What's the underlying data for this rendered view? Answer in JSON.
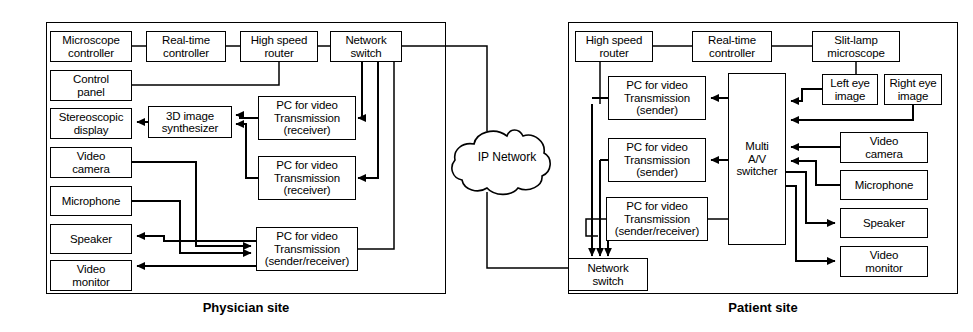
{
  "diagram": {
    "panels": [
      {
        "id": "physician",
        "caption": "Physician site",
        "frame": {
          "x": 46,
          "y": 22,
          "w": 400,
          "h": 272
        }
      },
      {
        "id": "patient",
        "caption": "Patient site",
        "frame": {
          "x": 568,
          "y": 22,
          "w": 390,
          "h": 272
        }
      }
    ],
    "cloud": {
      "label": "IP Network",
      "cx": 507,
      "cy": 156
    },
    "nodes": [
      {
        "id": "ph-microscope-controller",
        "lines": [
          "Microscope",
          "controller"
        ],
        "x": 50,
        "y": 31,
        "w": 82,
        "h": 31
      },
      {
        "id": "ph-realtime-controller",
        "lines": [
          "Real-time",
          "controller"
        ],
        "x": 146,
        "y": 31,
        "w": 80,
        "h": 31
      },
      {
        "id": "ph-high-speed-router",
        "lines": [
          "High speed",
          "router"
        ],
        "x": 240,
        "y": 31,
        "w": 78,
        "h": 31
      },
      {
        "id": "ph-network-switch",
        "lines": [
          "Network",
          "switch"
        ],
        "x": 330,
        "y": 31,
        "w": 72,
        "h": 31
      },
      {
        "id": "ph-control-panel",
        "lines": [
          "Control",
          "panel"
        ],
        "x": 50,
        "y": 70,
        "w": 82,
        "h": 31
      },
      {
        "id": "ph-stereoscopic-display",
        "lines": [
          "Stereoscopic",
          "display"
        ],
        "x": 50,
        "y": 108,
        "w": 82,
        "h": 31
      },
      {
        "id": "ph-3d-synthesizer",
        "lines": [
          "3D image",
          "synthesizer"
        ],
        "x": 148,
        "y": 106,
        "w": 84,
        "h": 32
      },
      {
        "id": "ph-video-camera",
        "lines": [
          "Video",
          "camera"
        ],
        "x": 50,
        "y": 147,
        "w": 82,
        "h": 31
      },
      {
        "id": "ph-microphone",
        "lines": [
          "Microphone"
        ],
        "x": 50,
        "y": 186,
        "w": 82,
        "h": 30
      },
      {
        "id": "ph-speaker",
        "lines": [
          "Speaker"
        ],
        "x": 50,
        "y": 224,
        "w": 82,
        "h": 30
      },
      {
        "id": "ph-video-monitor",
        "lines": [
          "Video",
          "monitor"
        ],
        "x": 50,
        "y": 260,
        "w": 82,
        "h": 31
      },
      {
        "id": "ph-pc-receiver-1",
        "lines": [
          "PC for video",
          "Transmission",
          "(receiver)"
        ],
        "x": 258,
        "y": 96,
        "w": 98,
        "h": 44
      },
      {
        "id": "ph-pc-receiver-2",
        "lines": [
          "PC for video",
          "Transmission",
          "(receiver)"
        ],
        "x": 258,
        "y": 156,
        "w": 98,
        "h": 44
      },
      {
        "id": "ph-pc-sender-receiver",
        "lines": [
          "PC for video",
          "Transmission",
          "(sender/receiver)"
        ],
        "x": 256,
        "y": 227,
        "w": 102,
        "h": 44
      },
      {
        "id": "pa-high-speed-router",
        "lines": [
          "High speed",
          "router"
        ],
        "x": 575,
        "y": 31,
        "w": 78,
        "h": 31
      },
      {
        "id": "pa-realtime-controller",
        "lines": [
          "Real-time",
          "controller"
        ],
        "x": 692,
        "y": 31,
        "w": 80,
        "h": 31
      },
      {
        "id": "pa-slitlamp-microscope",
        "lines": [
          "Slit-lamp",
          "microscope"
        ],
        "x": 812,
        "y": 31,
        "w": 88,
        "h": 31
      },
      {
        "id": "pa-pc-sender-1",
        "lines": [
          "PC for video",
          "Transmission",
          "(sender)"
        ],
        "x": 608,
        "y": 76,
        "w": 98,
        "h": 44
      },
      {
        "id": "pa-pc-sender-2",
        "lines": [
          "PC for video",
          "Transmission",
          "(sender)"
        ],
        "x": 608,
        "y": 138,
        "w": 98,
        "h": 44
      },
      {
        "id": "pa-pc-sender-receiver",
        "lines": [
          "PC for video",
          "Transmission",
          "(sender/receiver)"
        ],
        "x": 606,
        "y": 197,
        "w": 102,
        "h": 44
      },
      {
        "id": "pa-network-switch",
        "lines": [
          "Network",
          "switch"
        ],
        "x": 568,
        "y": 258,
        "w": 80,
        "h": 33
      },
      {
        "id": "pa-multi-av-switcher",
        "lines": [
          "Multi",
          "A/V",
          "switcher"
        ],
        "x": 728,
        "y": 73,
        "w": 58,
        "h": 172
      },
      {
        "id": "pa-left-eye-image",
        "lines": [
          "Left eye",
          "image"
        ],
        "x": 822,
        "y": 74,
        "w": 56,
        "h": 31
      },
      {
        "id": "pa-right-eye-image",
        "lines": [
          "Right eye",
          "image"
        ],
        "x": 884,
        "y": 74,
        "w": 58,
        "h": 31
      },
      {
        "id": "pa-video-camera",
        "lines": [
          "Video",
          "camera"
        ],
        "x": 840,
        "y": 132,
        "w": 88,
        "h": 31
      },
      {
        "id": "pa-microphone",
        "lines": [
          "Microphone"
        ],
        "x": 840,
        "y": 170,
        "w": 88,
        "h": 30
      },
      {
        "id": "pa-speaker",
        "lines": [
          "Speaker"
        ],
        "x": 840,
        "y": 208,
        "w": 88,
        "h": 30
      },
      {
        "id": "pa-video-monitor",
        "lines": [
          "Video",
          "monitor"
        ],
        "x": 840,
        "y": 246,
        "w": 88,
        "h": 31
      }
    ]
  }
}
